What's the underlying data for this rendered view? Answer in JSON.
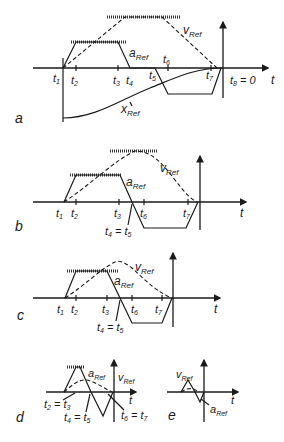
{
  "figure": {
    "colors": {
      "ink": "#1a1a1a",
      "background": "#ffffff"
    },
    "panels": [
      {
        "id": "a",
        "label": "a",
        "curves": {
          "velocity": "vRef",
          "acceleration": "aRef",
          "position": "xRef"
        },
        "time_axis": "t",
        "ticks": [
          "t1",
          "t2",
          "t3",
          "t4",
          "t5",
          "t6",
          "t7",
          "t8 = 0"
        ]
      },
      {
        "id": "b",
        "label": "b",
        "curves": {
          "velocity": "vRef",
          "acceleration": "aRef"
        },
        "time_axis": "t",
        "ticks": [
          "t1",
          "t2",
          "t3",
          "t4 = t5",
          "t6",
          "t7"
        ]
      },
      {
        "id": "c",
        "label": "c",
        "curves": {
          "velocity": "vRef",
          "acceleration": "aRef"
        },
        "time_axis": "t",
        "ticks": [
          "t1",
          "t2",
          "t3",
          "t4 = t5",
          "t6",
          "t7"
        ]
      },
      {
        "id": "d",
        "label": "d",
        "curves": {
          "velocity": "vRef",
          "acceleration": "aRef"
        },
        "time_axis": "t",
        "ticks": [
          "t2 = t3",
          "t4 = t5",
          "t6 = t7"
        ]
      },
      {
        "id": "e",
        "label": "e",
        "curves": {
          "velocity": "vRef",
          "acceleration": "aRef"
        },
        "time_axis": "t",
        "ticks": []
      }
    ]
  },
  "text": {
    "t": "t",
    "v": "v",
    "a": "a",
    "x": "x",
    "ref": "Ref",
    "t1": "t",
    "s1": "1",
    "t2": "t",
    "s2": "2",
    "t3": "t",
    "s3": "3",
    "t4": "t",
    "s4": "4",
    "t5": "t",
    "s5": "5",
    "t6": "t",
    "s6": "6",
    "t7": "t",
    "s7": "7",
    "t8": "t",
    "s8": "8",
    "eq0": " = 0",
    "eq": " = ",
    "panel_a": "a",
    "panel_b": "b",
    "panel_c": "c",
    "panel_d": "d",
    "panel_e": "e"
  }
}
